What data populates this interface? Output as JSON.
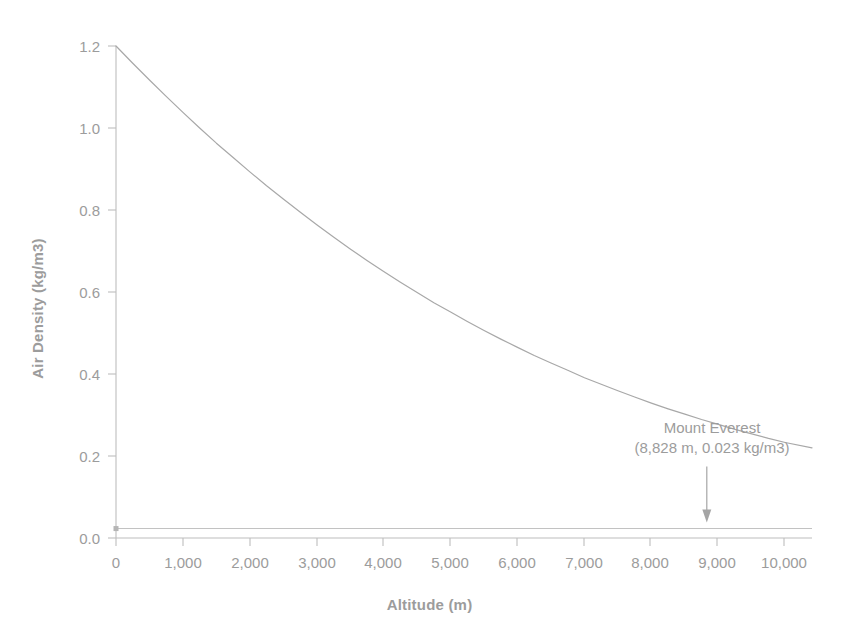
{
  "chart_data": {
    "type": "line",
    "title": "",
    "subtitle": "",
    "xlabel": "Altitude (m)",
    "ylabel": "Air Density (kg/m3)",
    "xlim": [
      0,
      10400
    ],
    "ylim": [
      0.0,
      1.2
    ],
    "grid": false,
    "legend": "none",
    "xticks": [
      0,
      1000,
      2000,
      3000,
      4000,
      5000,
      6000,
      7000,
      8000,
      9000,
      10000
    ],
    "xtick_labels": [
      "0",
      "1,000",
      "2,000",
      "3,000",
      "4,000",
      "5,000",
      "6,000",
      "7,000",
      "8,000",
      "9,000",
      "10,000"
    ],
    "yticks": [
      0.0,
      0.2,
      0.4,
      0.6,
      0.8,
      1.0,
      1.2
    ],
    "ytick_labels": [
      "0.0",
      "0.2",
      "0.4",
      "0.6",
      "0.8",
      "1.0",
      "1.2"
    ],
    "series": [
      {
        "name": "Air density vs altitude",
        "color": "#a8a8a8",
        "x": [
          0,
          250,
          500,
          750,
          1000,
          1250,
          1500,
          1750,
          2000,
          2250,
          2500,
          2750,
          3000,
          3250,
          3500,
          3750,
          4000,
          4250,
          4500,
          4750,
          5000,
          5250,
          5500,
          5750,
          6000,
          6250,
          6500,
          6750,
          7000,
          7250,
          7500,
          7750,
          8000,
          8250,
          8500,
          8750,
          9000,
          9250,
          9500,
          9750,
          10000,
          10400
        ],
        "values": [
          1.2,
          1.158,
          1.117,
          1.077,
          1.038,
          1.0,
          0.963,
          0.928,
          0.893,
          0.859,
          0.827,
          0.795,
          0.764,
          0.734,
          0.705,
          0.677,
          0.65,
          0.624,
          0.599,
          0.574,
          0.551,
          0.528,
          0.506,
          0.485,
          0.465,
          0.445,
          0.427,
          0.409,
          0.391,
          0.375,
          0.359,
          0.344,
          0.329,
          0.315,
          0.302,
          0.289,
          0.277,
          0.265,
          0.254,
          0.243,
          0.233,
          0.22
        ]
      },
      {
        "name": "Mount Everest density reference",
        "color": "#c2c2c2",
        "x": [
          0,
          10400
        ],
        "values": [
          0.023,
          0.023
        ]
      }
    ],
    "annotations": [
      {
        "name": "mount-everest",
        "line1": "Mount Everest",
        "line2": "(8,828 m, 0.023 kg/m3)",
        "point_x": 8828,
        "point_y": 0.023,
        "arrow": "down"
      }
    ]
  },
  "axes": {
    "y_title": "Air Density (kg/m3)",
    "x_title": "Altitude (m)"
  },
  "colors": {
    "curve": "#a8a8a8",
    "reference_line": "#c2c2c2",
    "axis": "#b0b0b0",
    "text": "#9c9c9c",
    "background": "#ffffff"
  }
}
